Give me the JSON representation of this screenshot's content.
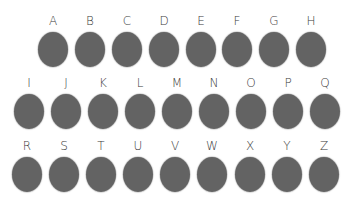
{
  "colors": {
    "background": "#ffffff",
    "dot": "#636363",
    "label": "#3a3a3a"
  },
  "rows": [
    {
      "items": [
        {
          "label": "A",
          "x": 38,
          "y": 14
        },
        {
          "label": "B",
          "x": 75,
          "y": 14
        },
        {
          "label": "C",
          "x": 112,
          "y": 14
        },
        {
          "label": "D",
          "x": 149,
          "y": 14
        },
        {
          "label": "E",
          "x": 186,
          "y": 14
        },
        {
          "label": "F",
          "x": 222,
          "y": 14
        },
        {
          "label": "G",
          "x": 259,
          "y": 14
        },
        {
          "label": "H",
          "x": 296,
          "y": 14
        }
      ]
    },
    {
      "items": [
        {
          "label": "I",
          "x": 14,
          "y": 76
        },
        {
          "label": "J",
          "x": 51,
          "y": 76
        },
        {
          "label": "K",
          "x": 88,
          "y": 76
        },
        {
          "label": "L",
          "x": 125,
          "y": 76
        },
        {
          "label": "M",
          "x": 162,
          "y": 76
        },
        {
          "label": "N",
          "x": 199,
          "y": 76
        },
        {
          "label": "O",
          "x": 236,
          "y": 76
        },
        {
          "label": "P",
          "x": 273,
          "y": 76
        },
        {
          "label": "Q",
          "x": 310,
          "y": 76
        }
      ]
    },
    {
      "items": [
        {
          "label": "R",
          "x": 12,
          "y": 139
        },
        {
          "label": "S",
          "x": 49,
          "y": 139
        },
        {
          "label": "T",
          "x": 86,
          "y": 139
        },
        {
          "label": "U",
          "x": 123,
          "y": 139
        },
        {
          "label": "V",
          "x": 160,
          "y": 139
        },
        {
          "label": "W",
          "x": 197,
          "y": 139
        },
        {
          "label": "X",
          "x": 235,
          "y": 139
        },
        {
          "label": "Y",
          "x": 272,
          "y": 139
        },
        {
          "label": "Z",
          "x": 309,
          "y": 139
        }
      ]
    }
  ]
}
